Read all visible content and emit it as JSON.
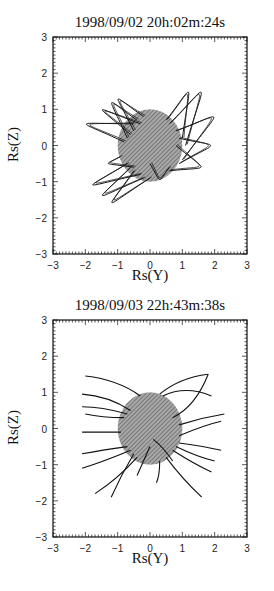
{
  "figure": {
    "panels": [
      {
        "title": "1998/09/02 20h:02m:24s",
        "xlabel": "Rs(Y)",
        "ylabel": "Rs(Z)"
      },
      {
        "title": "1998/09/03 22h:43m:38s",
        "xlabel": "Rs(Y)",
        "ylabel": "Rs(Z)"
      }
    ]
  },
  "chart_data": [
    {
      "type": "scatter",
      "title": "1998/09/02 20h:02m:24s",
      "xlabel": "Rs(Y)",
      "ylabel": "Rs(Z)",
      "xlim": [
        -3,
        3
      ],
      "ylim": [
        -3,
        3
      ],
      "xticks": [
        "−3",
        "−2",
        "−1",
        "0",
        "1",
        "2",
        "3"
      ],
      "yticks": [
        "3",
        "2",
        "1",
        "0",
        "−1",
        "−2",
        "−3"
      ],
      "disk": {
        "center": [
          0,
          0
        ],
        "radius": 1,
        "fill": "#8a8a8a"
      },
      "field_lines": "closed loops",
      "loops": [
        {
          "foot1": [
            -0.6,
            0.3
          ],
          "foot2": [
            -0.3,
            0.6
          ],
          "apex": [
            -1.5,
            1.0
          ]
        },
        {
          "foot1": [
            -0.7,
            0.2
          ],
          "foot2": [
            -0.4,
            0.7
          ],
          "apex": [
            -1.2,
            1.2
          ]
        },
        {
          "foot1": [
            -0.8,
            0.1
          ],
          "foot2": [
            -0.5,
            0.6
          ],
          "apex": [
            -2.0,
            0.6
          ]
        },
        {
          "foot1": [
            -0.5,
            0.4
          ],
          "foot2": [
            -0.2,
            0.8
          ],
          "apex": [
            -1.0,
            1.3
          ]
        },
        {
          "foot1": [
            0.6,
            0.6
          ],
          "foot2": [
            1.1,
            0.0
          ],
          "apex": [
            1.6,
            1.5
          ]
        },
        {
          "foot1": [
            0.5,
            0.7
          ],
          "foot2": [
            1.0,
            0.2
          ],
          "apex": [
            1.2,
            1.5
          ]
        },
        {
          "foot1": [
            0.8,
            0.4
          ],
          "foot2": [
            1.0,
            -0.4
          ],
          "apex": [
            2.0,
            0.8
          ]
        },
        {
          "foot1": [
            0.9,
            0.2
          ],
          "foot2": [
            0.9,
            -0.5
          ],
          "apex": [
            1.9,
            0.0
          ]
        },
        {
          "foot1": [
            0.8,
            0.0
          ],
          "foot2": [
            0.6,
            -0.7
          ],
          "apex": [
            1.6,
            -0.6
          ]
        },
        {
          "foot1": [
            -0.6,
            -0.6
          ],
          "foot2": [
            -0.2,
            -0.9
          ],
          "apex": [
            -1.5,
            -1.4
          ]
        },
        {
          "foot1": [
            -0.5,
            -0.7
          ],
          "foot2": [
            0.0,
            -0.9
          ],
          "apex": [
            -1.2,
            -1.6
          ]
        },
        {
          "foot1": [
            -0.7,
            -0.5
          ],
          "foot2": [
            -0.3,
            -0.8
          ],
          "apex": [
            -1.8,
            -1.1
          ]
        },
        {
          "foot1": [
            -0.9,
            -0.3
          ],
          "foot2": [
            -0.5,
            -0.6
          ],
          "apex": [
            -1.3,
            -0.5
          ]
        },
        {
          "foot1": [
            0.0,
            -0.5
          ],
          "foot2": [
            0.6,
            -0.6
          ],
          "apex": [
            0.3,
            -0.95
          ]
        }
      ]
    },
    {
      "type": "scatter",
      "title": "1998/09/03 22h:43m:38s",
      "xlabel": "Rs(Y)",
      "ylabel": "Rs(Z)",
      "xlim": [
        -3,
        3
      ],
      "ylim": [
        -3,
        3
      ],
      "xticks": [
        "−3",
        "−2",
        "−1",
        "0",
        "1",
        "2",
        "3"
      ],
      "yticks": [
        "3",
        "2",
        "1",
        "0",
        "−1",
        "−2",
        "−3"
      ],
      "disk": {
        "center": [
          0,
          0
        ],
        "radius": 1,
        "fill": "#8a8a8a"
      },
      "field_lines": "open field lines",
      "lines": [
        [
          [
            -0.3,
            0.9
          ],
          [
            -1.0,
            1.35
          ],
          [
            -2.0,
            1.45
          ]
        ],
        [
          [
            -0.6,
            0.5
          ],
          [
            -1.3,
            0.9
          ],
          [
            -2.1,
            0.95
          ]
        ],
        [
          [
            -0.7,
            0.4
          ],
          [
            -1.5,
            0.6
          ],
          [
            -2.1,
            0.6
          ]
        ],
        [
          [
            -0.8,
            0.3
          ],
          [
            -1.5,
            0.3
          ],
          [
            -2.0,
            0.4
          ]
        ],
        [
          [
            -0.9,
            -0.1
          ],
          [
            -1.6,
            -0.1
          ],
          [
            -2.1,
            -0.1
          ]
        ],
        [
          [
            -0.7,
            -0.5
          ],
          [
            -1.5,
            -0.6
          ],
          [
            -2.1,
            -0.7
          ]
        ],
        [
          [
            -0.6,
            -0.6
          ],
          [
            -1.4,
            -0.9
          ],
          [
            -2.1,
            -1.1
          ]
        ],
        [
          [
            -0.4,
            -0.8
          ],
          [
            -1.0,
            -1.4
          ],
          [
            -1.7,
            -1.8
          ]
        ],
        [
          [
            -0.5,
            -0.7
          ],
          [
            -0.9,
            -1.3
          ],
          [
            -1.2,
            -1.9
          ]
        ],
        [
          [
            0.3,
            0.95
          ],
          [
            0.9,
            1.4
          ],
          [
            1.8,
            1.5
          ]
        ],
        [
          [
            0.4,
            0.9
          ],
          [
            1.1,
            1.2
          ],
          [
            1.9,
            0.9
          ]
        ],
        [
          [
            0.7,
            0.3
          ],
          [
            1.4,
            0.6
          ],
          [
            1.8,
            1.5
          ]
        ],
        [
          [
            0.9,
            0.1
          ],
          [
            1.6,
            0.3
          ],
          [
            2.3,
            0.4
          ]
        ],
        [
          [
            0.9,
            -0.2
          ],
          [
            1.7,
            0.1
          ],
          [
            2.2,
            0.2
          ]
        ],
        [
          [
            0.9,
            -0.4
          ],
          [
            1.7,
            -0.5
          ],
          [
            2.2,
            -0.6
          ]
        ],
        [
          [
            0.8,
            -0.5
          ],
          [
            1.5,
            -0.8
          ],
          [
            2.0,
            -0.9
          ]
        ],
        [
          [
            0.7,
            -0.6
          ],
          [
            1.4,
            -1.0
          ],
          [
            1.9,
            -1.2
          ]
        ],
        [
          [
            0.5,
            -0.8
          ],
          [
            1.0,
            -1.4
          ],
          [
            1.6,
            -1.9
          ]
        ],
        [
          [
            0.3,
            -0.9
          ],
          [
            0.3,
            -1.3
          ],
          [
            0.2,
            -1.5
          ]
        ],
        [
          [
            0.0,
            -0.5
          ],
          [
            -0.2,
            -0.9
          ],
          [
            -0.4,
            -1.3
          ]
        ],
        [
          [
            0.1,
            -0.3
          ],
          [
            0.4,
            -0.5
          ],
          [
            0.7,
            -0.9
          ]
        ]
      ]
    }
  ]
}
